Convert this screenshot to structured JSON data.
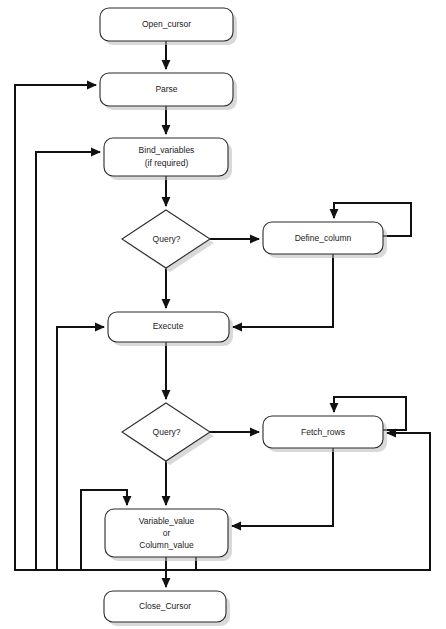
{
  "diagram": {
    "type": "flowchart",
    "width": 446,
    "height": 629,
    "background_color": "#ffffff",
    "line_color": "#111111",
    "node_fill": "#ffffff",
    "node_stroke": "#2b2b2b",
    "text_color": "#1a1a1a"
  },
  "nodes": [
    {
      "id": "open_cursor",
      "shape": "rounded-rect",
      "label": "Open_cursor",
      "lines": [
        "Open_cursor"
      ],
      "x": 100,
      "y": 8,
      "w": 133,
      "h": 33
    },
    {
      "id": "parse",
      "shape": "rounded-rect",
      "label": "Parse",
      "lines": [
        "Parse"
      ],
      "x": 100,
      "y": 73,
      "w": 133,
      "h": 33
    },
    {
      "id": "bind_variables",
      "shape": "rounded-rect",
      "label": "Bind_variables (if required)",
      "lines": [
        "Bind_variables",
        "(if required)"
      ],
      "x": 104,
      "y": 138,
      "w": 124,
      "h": 38
    },
    {
      "id": "query_1",
      "shape": "diamond",
      "label": "Query?",
      "lines": [
        "Query?"
      ],
      "cx": 166,
      "cy": 239,
      "rx": 44,
      "ry": 29
    },
    {
      "id": "define_column",
      "shape": "rounded-rect",
      "label": "Define_column",
      "lines": [
        "Define_column"
      ],
      "x": 263,
      "y": 222,
      "w": 120,
      "h": 32
    },
    {
      "id": "execute",
      "shape": "rounded-rect",
      "label": "Execute",
      "lines": [
        "Execute"
      ],
      "x": 108,
      "y": 312,
      "w": 121,
      "h": 30
    },
    {
      "id": "query_2",
      "shape": "diamond",
      "label": "Query?",
      "lines": [
        "Query?"
      ],
      "cx": 166,
      "cy": 432,
      "rx": 44,
      "ry": 29
    },
    {
      "id": "fetch_rows",
      "shape": "rounded-rect",
      "label": "Fetch_rows",
      "lines": [
        "Fetch_rows"
      ],
      "x": 263,
      "y": 416,
      "w": 120,
      "h": 32
    },
    {
      "id": "variable_value",
      "shape": "rounded-rect",
      "label": "Variable_value or Column_value",
      "lines": [
        "Variable_value",
        "or",
        "Column_value"
      ],
      "x": 105,
      "y": 509,
      "w": 123,
      "h": 48
    },
    {
      "id": "close_cursor",
      "shape": "rounded-rect",
      "label": "Close_Cursor",
      "lines": [
        "Close_Cursor"
      ],
      "x": 104,
      "y": 591,
      "w": 122,
      "h": 31
    }
  ],
  "edges": [
    {
      "id": "open-to-parse",
      "from": "open_cursor",
      "to": "parse",
      "arrow": true
    },
    {
      "id": "parse-to-bind",
      "from": "parse",
      "to": "bind_variables",
      "arrow": true
    },
    {
      "id": "bind-to-query1",
      "from": "bind_variables",
      "to": "query_1",
      "arrow": true
    },
    {
      "id": "query1-to-define",
      "from": "query_1",
      "to": "define_column",
      "arrow": true
    },
    {
      "id": "define-self-loop",
      "from": "define_column",
      "to": "define_column",
      "arrow": true
    },
    {
      "id": "define-to-execute",
      "from": "define_column",
      "to": "execute",
      "arrow": true
    },
    {
      "id": "query1-to-execute",
      "from": "query_1",
      "to": "execute",
      "arrow": true
    },
    {
      "id": "execute-to-query2",
      "from": "execute",
      "to": "query_2",
      "arrow": true
    },
    {
      "id": "query2-to-fetch",
      "from": "query_2",
      "to": "fetch_rows",
      "arrow": true
    },
    {
      "id": "fetch-self-loop",
      "from": "fetch_rows",
      "to": "fetch_rows",
      "arrow": true
    },
    {
      "id": "fetch-to-variable",
      "from": "fetch_rows",
      "to": "variable_value",
      "arrow": true
    },
    {
      "id": "query2-to-variable",
      "from": "query_2",
      "to": "variable_value",
      "arrow": true
    },
    {
      "id": "variable-to-close",
      "from": "variable_value",
      "to": "close_cursor",
      "arrow": true
    },
    {
      "id": "feedback-to-parse",
      "from": "variable_value",
      "to": "parse",
      "arrow": true
    },
    {
      "id": "feedback-to-bind",
      "from": "variable_value",
      "to": "bind_variables",
      "arrow": true
    },
    {
      "id": "feedback-to-execute",
      "from": "variable_value",
      "to": "execute",
      "arrow": true
    },
    {
      "id": "feedback-to-variable",
      "from": "variable_value",
      "to": "variable_value",
      "arrow": true
    },
    {
      "id": "feedback-to-fetch",
      "from": "variable_value",
      "to": "fetch_rows",
      "arrow": true
    }
  ]
}
